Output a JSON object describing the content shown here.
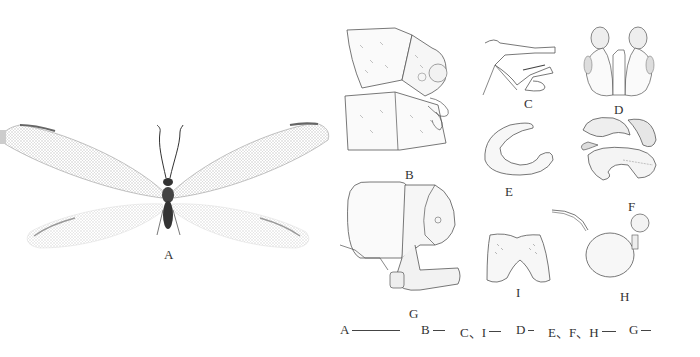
{
  "figure": {
    "panels": [
      {
        "id": "A",
        "label": "A",
        "description": "Adult lacewing (habitus, dorsal view)"
      },
      {
        "id": "B",
        "label": "B",
        "description": "Male terminalia, lateral view"
      },
      {
        "id": "C",
        "label": "C",
        "description": "Genital sclerite, lateral view"
      },
      {
        "id": "D",
        "label": "D",
        "description": "Genital structure, ventral view"
      },
      {
        "id": "E",
        "label": "E",
        "description": "Sclerite, lateral view"
      },
      {
        "id": "F",
        "label": "F",
        "description": "Genital complex, lateral view"
      },
      {
        "id": "G",
        "label": "G",
        "description": "Female terminalia, lateral view"
      },
      {
        "id": "H",
        "label": "H",
        "description": "Spermatheca"
      },
      {
        "id": "I",
        "label": "I",
        "description": "Subgenitale, ventral view"
      }
    ],
    "scale_bars": [
      {
        "label": "A",
        "length_px": 48
      },
      {
        "label": "B",
        "length_px": 12
      },
      {
        "label": "C、I",
        "length_px": 12
      },
      {
        "label": "D",
        "length_px": 6
      },
      {
        "label": "E、F、H",
        "length_px": 14
      },
      {
        "label": "G",
        "length_px": 10
      }
    ]
  }
}
